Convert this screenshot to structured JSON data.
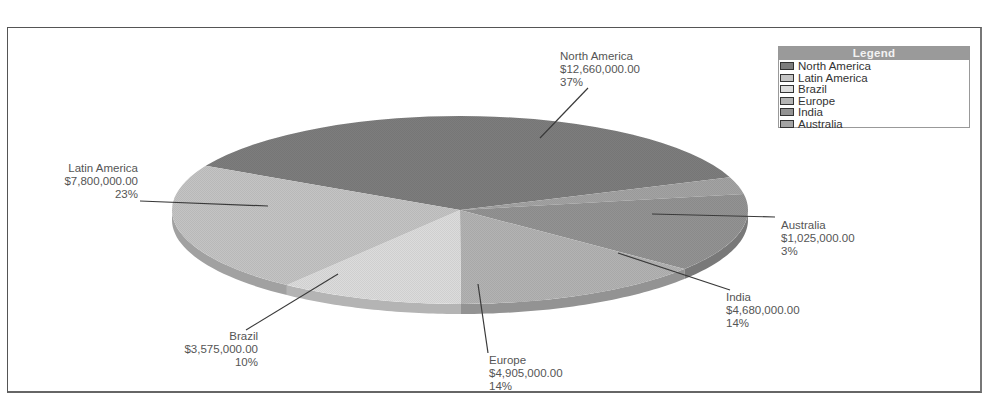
{
  "chart_data": {
    "type": "pie",
    "title": "",
    "style": "3d-pie",
    "legend_title": "Legend",
    "legend_position": "top-right",
    "slices": [
      {
        "name": "North America",
        "value": 12660000,
        "value_label": "$12,660,000.00",
        "percent": 37,
        "percent_label": "37%",
        "color": "#7d7d7d"
      },
      {
        "name": "Latin America",
        "value": 7800000,
        "value_label": "$7,800,000.00",
        "percent": 23,
        "percent_label": "23%",
        "color": "#c4c4c4"
      },
      {
        "name": "Brazil",
        "value": 3575000,
        "value_label": "$3,575,000.00",
        "percent": 10,
        "percent_label": "10%",
        "color": "#dcdcdc"
      },
      {
        "name": "Europe",
        "value": 4905000,
        "value_label": "$4,905,000.00",
        "percent": 14,
        "percent_label": "14%",
        "color": "#b3b3b3"
      },
      {
        "name": "India",
        "value": 4680000,
        "value_label": "$4,680,000.00",
        "percent": 14,
        "percent_label": "14%",
        "color": "#939393"
      },
      {
        "name": "Australia",
        "value": 1025000,
        "value_label": "$1,025,000.00",
        "percent": 3,
        "percent_label": "3%",
        "color": "#a3a3a3"
      }
    ]
  },
  "legend": {
    "title": "Legend",
    "items": [
      {
        "label": "North America",
        "color": "#7d7d7d"
      },
      {
        "label": "Latin America",
        "color": "#c4c4c4"
      },
      {
        "label": "Brazil",
        "color": "#dcdcdc"
      },
      {
        "label": "Europe",
        "color": "#b3b3b3"
      },
      {
        "label": "India",
        "color": "#939393"
      },
      {
        "label": "Australia",
        "color": "#a3a3a3"
      }
    ]
  },
  "labels": {
    "north_america": {
      "name": "North America",
      "value": "$12,660,000.00",
      "pct": "37%"
    },
    "latin_america": {
      "name": "Latin America",
      "value": "$7,800,000.00",
      "pct": "23%"
    },
    "brazil": {
      "name": "Brazil",
      "value": "$3,575,000.00",
      "pct": "10%"
    },
    "europe": {
      "name": "Europe",
      "value": "$4,905,000.00",
      "pct": "14%"
    },
    "india": {
      "name": "India",
      "value": "$4,680,000.00",
      "pct": "14%"
    },
    "australia": {
      "name": "Australia",
      "value": "$1,025,000.00",
      "pct": "3%"
    }
  }
}
